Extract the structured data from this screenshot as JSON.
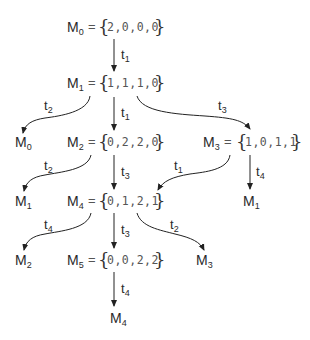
{
  "markings": [
    {
      "id": "M0",
      "name": "M",
      "sub": "0",
      "values": "2,0,0,0"
    },
    {
      "id": "M1",
      "name": "M",
      "sub": "1",
      "values": "1,1,1,0"
    },
    {
      "id": "M2",
      "name": "M",
      "sub": "2",
      "values": "0,2,2,0"
    },
    {
      "id": "M3",
      "name": "M",
      "sub": "3",
      "values": "1,0,1,1"
    },
    {
      "id": "M4",
      "name": "M",
      "sub": "4",
      "values": "0,1,2,1"
    },
    {
      "id": "M5",
      "name": "M",
      "sub": "5",
      "values": "0,0,2,2"
    }
  ],
  "leaves": [
    {
      "name": "M",
      "sub": "0"
    },
    {
      "name": "M",
      "sub": "1"
    },
    {
      "name": "M",
      "sub": "1"
    },
    {
      "name": "M",
      "sub": "2"
    },
    {
      "name": "M",
      "sub": "3"
    },
    {
      "name": "M",
      "sub": "4"
    }
  ],
  "edges": [
    {
      "from": "M0",
      "to": "M1",
      "t": "t",
      "sub": "1"
    },
    {
      "from": "M1",
      "to": "M0 (leaf)",
      "t": "t",
      "sub": "2"
    },
    {
      "from": "M1",
      "to": "M2",
      "t": "t",
      "sub": "1"
    },
    {
      "from": "M1",
      "to": "M3",
      "t": "t",
      "sub": "3"
    },
    {
      "from": "M2",
      "to": "M1 (leaf)",
      "t": "t",
      "sub": "2"
    },
    {
      "from": "M2",
      "to": "M4",
      "t": "t",
      "sub": "3"
    },
    {
      "from": "M3",
      "to": "M4",
      "t": "t",
      "sub": "1"
    },
    {
      "from": "M3",
      "to": "M1 (leaf)",
      "t": "t",
      "sub": "4"
    },
    {
      "from": "M4",
      "to": "M2 (leaf)",
      "t": "t",
      "sub": "4"
    },
    {
      "from": "M4",
      "to": "M5",
      "t": "t",
      "sub": "3"
    },
    {
      "from": "M4",
      "to": "M3 (leaf)",
      "t": "t",
      "sub": "2"
    },
    {
      "from": "M5",
      "to": "M4 (leaf)",
      "t": "t",
      "sub": "4"
    }
  ],
  "symbols": {
    "equals": "=",
    "open_brace": "{",
    "close_brace": "}"
  }
}
